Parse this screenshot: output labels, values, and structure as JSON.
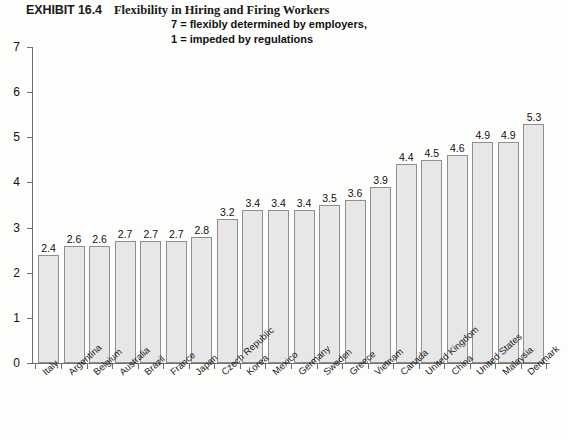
{
  "title": {
    "exhibit_label": "EXHIBIT 16.4",
    "caption": "Flexibility in Hiring and Firing Workers",
    "subtitle_line1": "7 = flexibly determined by employers,",
    "subtitle_line2": "1 = impeded by regulations"
  },
  "chart_data": {
    "type": "bar",
    "title": "Flexibility in Hiring and Firing Workers",
    "subtitle": "7 = flexibly determined by employers, 1 = impeded by regulations",
    "xlabel": "",
    "ylabel": "",
    "ylim": [
      0,
      7
    ],
    "ytick_labels": [
      "0",
      "1",
      "2",
      "3",
      "4",
      "5",
      "6",
      "7"
    ],
    "yticks": [
      0,
      1,
      2,
      3,
      4,
      5,
      6,
      7
    ],
    "grid": false,
    "legend": false,
    "bar_fill_color": "#e7e7e7",
    "bar_border_color": "#8f8f8f",
    "axis_color": "#6e6e6e",
    "categories": [
      "Italy",
      "Argentina",
      "Belgium",
      "Australia",
      "Brazil",
      "France",
      "Japan",
      "Czech Republic",
      "Korea",
      "Mexico",
      "Germany",
      "Sweden",
      "Greece",
      "Vietnam",
      "Canada",
      "United Kingdom",
      "China",
      "United States",
      "Malaysia",
      "Denmark"
    ],
    "values": [
      2.4,
      2.6,
      2.6,
      2.7,
      2.7,
      2.7,
      2.8,
      3.2,
      3.4,
      3.4,
      3.4,
      3.5,
      3.6,
      3.9,
      4.4,
      4.5,
      4.6,
      4.9,
      4.9,
      5.3
    ],
    "value_labels": [
      "2.4",
      "2.6",
      "2.6",
      "2.7",
      "2.7",
      "2.7",
      "2.8",
      "3.2",
      "3.4",
      "3.4",
      "3.4",
      "3.5",
      "3.6",
      "3.9",
      "4.4",
      "4.5",
      "4.6",
      "4.9",
      "4.9",
      "5.3"
    ]
  }
}
